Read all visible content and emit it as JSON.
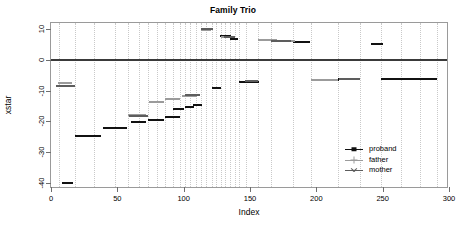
{
  "chart_data": {
    "type": "line",
    "title": "Family Trio",
    "xlabel": "Index",
    "ylabel": "xstar",
    "xlim": [
      0,
      300
    ],
    "ylim": [
      -42,
      12
    ],
    "xticks": [
      0,
      50,
      100,
      150,
      200,
      250,
      300
    ],
    "yticks": [
      10,
      0,
      -10,
      -20,
      -30,
      -40
    ],
    "grid": "vertical-dotted",
    "legend_position": "right-middle",
    "zero_reference_line": 0,
    "legend": [
      {
        "label": "proband",
        "color": "#111111",
        "marker": "square"
      },
      {
        "label": "father",
        "color": "#9b9b9b",
        "marker": "plus"
      },
      {
        "label": "mother",
        "color": "#5d5d5d",
        "marker": "cross"
      }
    ],
    "series": [
      {
        "name": "proband",
        "color": "#111111",
        "segments": [
          {
            "x0": 8,
            "x1": 17,
            "y": -40.0
          },
          {
            "x0": 18,
            "x1": 38,
            "y": -24.7
          },
          {
            "x0": 39,
            "x1": 57,
            "y": -22.1
          },
          {
            "x0": 60,
            "x1": 72,
            "y": -20.2
          },
          {
            "x0": 73,
            "x1": 85,
            "y": -19.6
          },
          {
            "x0": 86,
            "x1": 97,
            "y": -18.4
          },
          {
            "x0": 92,
            "x1": 100,
            "y": -15.9
          },
          {
            "x0": 101,
            "x1": 108,
            "y": -15.3
          },
          {
            "x0": 107,
            "x1": 114,
            "y": -14.5
          },
          {
            "x0": 121,
            "x1": 128,
            "y": -9.1
          },
          {
            "x0": 127,
            "x1": 136,
            "y": 7.9
          },
          {
            "x0": 135,
            "x1": 141,
            "y": 6.7
          },
          {
            "x0": 142,
            "x1": 157,
            "y": -7.2
          },
          {
            "x0": 156,
            "x1": 166,
            "y": 6.4
          },
          {
            "x0": 167,
            "x1": 182,
            "y": 6.1
          },
          {
            "x0": 182,
            "x1": 195,
            "y": 5.9
          },
          {
            "x0": 196,
            "x1": 217,
            "y": -6.5
          },
          {
            "x0": 216,
            "x1": 233,
            "y": -6.2
          },
          {
            "x0": 241,
            "x1": 250,
            "y": 5.3
          },
          {
            "x0": 249,
            "x1": 291,
            "y": -6.3
          }
        ]
      },
      {
        "name": "father",
        "color": "#9b9b9b",
        "segments": [
          {
            "x0": 5,
            "x1": 16,
            "y": -7.4
          },
          {
            "x0": 58,
            "x1": 72,
            "y": -18.0
          },
          {
            "x0": 74,
            "x1": 85,
            "y": -13.6
          },
          {
            "x0": 86,
            "x1": 97,
            "y": -12.6
          },
          {
            "x0": 99,
            "x1": 110,
            "y": -11.7
          },
          {
            "x0": 113,
            "x1": 121,
            "y": 9.6
          },
          {
            "x0": 128,
            "x1": 137,
            "y": 7.6
          },
          {
            "x0": 156,
            "x1": 170,
            "y": 6.4
          },
          {
            "x0": 171,
            "x1": 184,
            "y": 6.0
          },
          {
            "x0": 196,
            "x1": 216,
            "y": -6.5
          }
        ]
      },
      {
        "name": "mother",
        "color": "#5d5d5d",
        "segments": [
          {
            "x0": 4,
            "x1": 18,
            "y": -8.5
          },
          {
            "x0": 59,
            "x1": 73,
            "y": -18.2
          },
          {
            "x0": 101,
            "x1": 112,
            "y": -11.5
          },
          {
            "x0": 113,
            "x1": 122,
            "y": 10.2
          },
          {
            "x0": 130,
            "x1": 139,
            "y": 7.4
          },
          {
            "x0": 146,
            "x1": 156,
            "y": -7.0
          },
          {
            "x0": 166,
            "x1": 181,
            "y": 6.2
          },
          {
            "x0": 217,
            "x1": 233,
            "y": -6.2
          }
        ]
      }
    ],
    "gridline_x_positions": [
      6,
      18,
      32,
      48,
      58,
      66,
      73,
      80,
      86,
      92,
      97,
      101,
      105,
      109,
      113,
      117,
      121,
      124,
      128,
      131,
      135,
      139,
      142,
      147,
      156,
      166,
      182,
      196,
      216,
      233,
      249,
      264,
      278,
      291
    ]
  }
}
